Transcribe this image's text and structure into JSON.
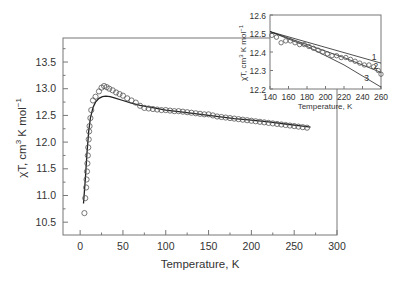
{
  "chart_data": [
    {
      "type": "scatter",
      "title": "",
      "xlabel": "Temperature, K",
      "ylabel": "χT, cm³ K mol⁻¹",
      "xlim": [
        -20,
        300
      ],
      "ylim": [
        10.26,
        13.95
      ],
      "xticks": [
        0,
        50,
        100,
        150,
        200,
        250,
        300
      ],
      "yticks": [
        10.5,
        11.0,
        11.5,
        12.0,
        12.5,
        13.0,
        13.5
      ],
      "grid": false,
      "series": [
        {
          "name": "experimental",
          "style": "open-circles",
          "x": [
            5,
            6,
            7,
            7.5,
            8,
            8.5,
            9,
            9.5,
            10,
            10.5,
            11,
            12,
            13,
            15,
            18,
            22,
            25,
            28,
            31,
            34,
            38,
            42,
            46,
            50,
            55,
            60,
            65,
            70,
            75,
            80,
            85,
            90,
            95,
            100,
            105,
            110,
            115,
            120,
            125,
            130,
            135,
            140,
            145,
            150,
            155,
            160,
            165,
            170,
            175,
            180,
            185,
            190,
            195,
            200,
            205,
            210,
            215,
            220,
            225,
            230,
            235,
            240,
            245,
            250,
            255,
            260,
            265
          ],
          "y": [
            10.67,
            10.95,
            11.15,
            11.3,
            11.45,
            11.6,
            11.75,
            11.9,
            12.05,
            12.2,
            12.3,
            12.45,
            12.6,
            12.78,
            12.85,
            12.95,
            13.02,
            13.05,
            13.03,
            13.0,
            12.97,
            12.93,
            12.9,
            12.87,
            12.82,
            12.78,
            12.74,
            12.68,
            12.64,
            12.63,
            12.62,
            12.61,
            12.6,
            12.6,
            12.59,
            12.58,
            12.58,
            12.57,
            12.56,
            12.55,
            12.54,
            12.53,
            12.52,
            12.52,
            12.5,
            12.48,
            12.47,
            12.46,
            12.45,
            12.44,
            12.43,
            12.42,
            12.41,
            12.4,
            12.39,
            12.38,
            12.37,
            12.36,
            12.35,
            12.34,
            12.33,
            12.32,
            12.31,
            12.3,
            12.29,
            12.28,
            12.27
          ]
        },
        {
          "name": "fit",
          "style": "solid-line",
          "x": [
            4,
            6,
            8,
            10,
            12,
            15,
            18,
            22,
            26,
            30,
            35,
            40,
            50,
            60,
            70,
            80,
            100,
            120,
            150,
            180,
            200,
            220,
            240,
            260,
            269
          ],
          "y": [
            10.85,
            11.3,
            11.8,
            12.2,
            12.45,
            12.65,
            12.75,
            12.82,
            12.85,
            12.86,
            12.85,
            12.83,
            12.78,
            12.73,
            12.69,
            12.66,
            12.6,
            12.56,
            12.5,
            12.44,
            12.41,
            12.38,
            12.34,
            12.3,
            12.28
          ]
        }
      ]
    },
    {
      "type": "scatter",
      "title": "inset",
      "xlabel": "Temperature, K",
      "ylabel": "χT, cm³ K mol⁻¹",
      "xlim": [
        140,
        260
      ],
      "ylim": [
        12.2,
        12.6
      ],
      "xticks": [
        140,
        160,
        180,
        200,
        220,
        240,
        260
      ],
      "yticks": [
        12.2,
        12.3,
        12.4,
        12.5,
        12.6
      ],
      "grid": false,
      "annotations": [
        "1",
        "2",
        "3"
      ],
      "series": [
        {
          "name": "experimental",
          "style": "open-circles",
          "x": [
            142,
            147,
            152,
            157,
            162,
            167,
            172,
            177,
            182,
            187,
            192,
            197,
            202,
            207,
            212,
            217,
            222,
            227,
            232,
            237,
            242,
            247,
            252,
            257,
            260
          ],
          "y": [
            12.49,
            12.48,
            12.45,
            12.46,
            12.46,
            12.45,
            12.44,
            12.44,
            12.43,
            12.42,
            12.41,
            12.4,
            12.39,
            12.38,
            12.38,
            12.37,
            12.37,
            12.36,
            12.35,
            12.34,
            12.33,
            12.33,
            12.32,
            12.3,
            12.28
          ]
        },
        {
          "name": "1",
          "style": "solid-line",
          "x": [
            140,
            260
          ],
          "y": [
            12.51,
            12.34
          ]
        },
        {
          "name": "2",
          "style": "solid-line",
          "x": [
            140,
            180,
            220,
            260
          ],
          "y": [
            12.51,
            12.44,
            12.37,
            12.29
          ]
        },
        {
          "name": "3",
          "style": "solid-line",
          "x": [
            140,
            180,
            220,
            260
          ],
          "y": [
            12.51,
            12.43,
            12.33,
            12.21
          ]
        }
      ]
    }
  ],
  "labels": {
    "main_xlabel": "Temperature, K",
    "main_ylabel_prefix": "χT, cm",
    "main_ylabel_sup": "3",
    "main_ylabel_mid": " K mol",
    "main_ylabel_sup2": "−1",
    "inset_xlabel": "Temperature, K"
  }
}
